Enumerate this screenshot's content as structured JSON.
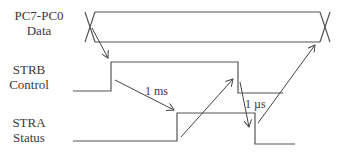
{
  "signals": [
    {
      "id": "data",
      "name": "PC7-PC0",
      "desc": "Data"
    },
    {
      "id": "strb",
      "name": "STRB",
      "desc": "Control"
    },
    {
      "id": "stra",
      "name": "STRA",
      "desc": "Status"
    }
  ],
  "annotations": {
    "strb_to_stra_delay": "1 ms",
    "stra_fall_delay": "1 µs"
  },
  "colors": {
    "line": "#555555",
    "text": "#3a3a3a"
  }
}
